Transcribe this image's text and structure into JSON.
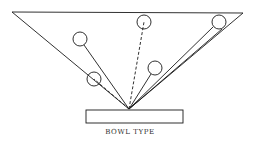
{
  "diagram": {
    "caption": "BOWL TYPE",
    "stroke_color": "#1a1a1a",
    "background": "#ffffff"
  }
}
